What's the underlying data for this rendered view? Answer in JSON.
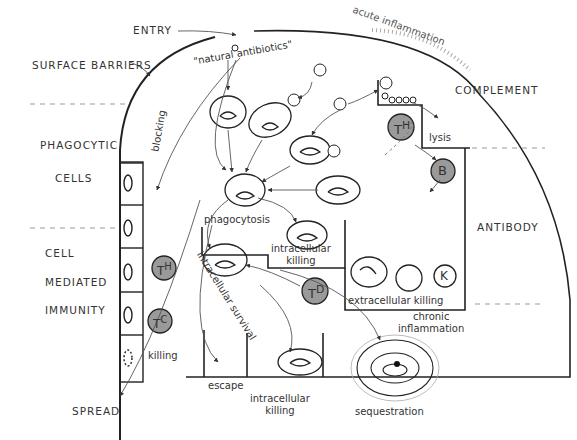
{
  "diagram": {
    "section_labels": {
      "entry": "ENTRY",
      "surface_barriers": "SURFACE BARRIERS",
      "phagocytic_1": "PHAGOCYTIC",
      "phagocytic_2": "CELLS",
      "cell_1": "CELL",
      "cell_2": "MEDIATED",
      "cell_3": "IMMUNITY",
      "spread": "SPREAD",
      "complement": "COMPLEMENT",
      "antibody": "ANTIBODY"
    },
    "process_labels": {
      "natural_antibiotics": "\"natural antibiotics\"",
      "acute_inflammation": "acute inflammation",
      "blocking": "blocking",
      "lysis": "lysis",
      "phagocytosis": "phagocytosis",
      "intracellular_killing_1a": "intracellular",
      "intracellular_killing_1b": "killing",
      "intracellular_survival": "intracellular survival",
      "extracellular_killing": "extracellular  killing",
      "killing": "killing",
      "escape": "escape",
      "intracellular_killing_2a": "intracellular",
      "intracellular_killing_2b": "killing",
      "sequestration": "sequestration",
      "chronic_inflammation_a": "chronic",
      "chronic_inflammation_b": "inflammation"
    },
    "cell_labels": {
      "th_top": "T",
      "th_top_sup": "H",
      "b_cell": "B",
      "k_cell": "K",
      "td": "T",
      "td_sup": "D",
      "th_left": "T",
      "th_left_sup": "H",
      "tc": "T",
      "tc_sup": "C"
    },
    "complement_tag": "C3",
    "colors": {
      "line": "#222222",
      "lymphocyte_fill": "#9a9a9a",
      "dashed": "#888888"
    }
  }
}
